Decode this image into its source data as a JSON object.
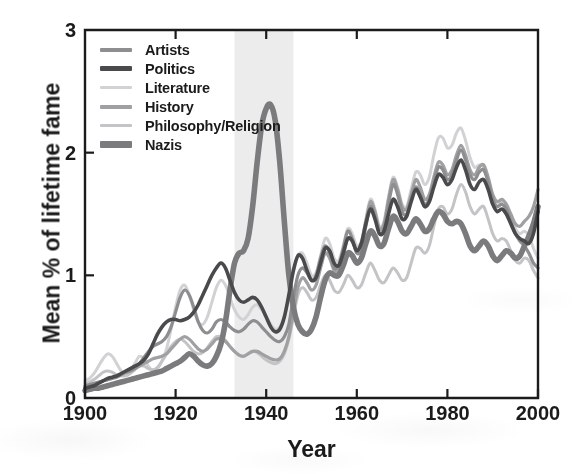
{
  "chart_data": {
    "type": "line",
    "title": "",
    "xlabel": "Year",
    "ylabel": "Mean % of lifetime fame",
    "xlim": [
      1900,
      2000
    ],
    "ylim": [
      0,
      3
    ],
    "xticks": [
      1900,
      1920,
      1940,
      1960,
      1980,
      2000
    ],
    "yticks": [
      0,
      1,
      2,
      3
    ],
    "grid": false,
    "legend_position": "top-left-inside",
    "annotations": [
      {
        "name": "nazi-era-shaded-band",
        "type": "vspan",
        "x_start": 1933,
        "x_end": 1946,
        "color": "#ececed",
        "label": ""
      }
    ],
    "x": [
      1900,
      1901,
      1902,
      1903,
      1904,
      1905,
      1906,
      1907,
      1908,
      1909,
      1910,
      1911,
      1912,
      1913,
      1914,
      1915,
      1916,
      1917,
      1918,
      1919,
      1920,
      1921,
      1922,
      1923,
      1924,
      1925,
      1926,
      1927,
      1928,
      1929,
      1930,
      1931,
      1932,
      1933,
      1934,
      1935,
      1936,
      1937,
      1938,
      1939,
      1940,
      1941,
      1942,
      1943,
      1944,
      1945,
      1946,
      1947,
      1948,
      1949,
      1950,
      1951,
      1952,
      1953,
      1954,
      1955,
      1956,
      1957,
      1958,
      1959,
      1960,
      1961,
      1962,
      1963,
      1964,
      1965,
      1966,
      1967,
      1968,
      1969,
      1970,
      1971,
      1972,
      1973,
      1974,
      1975,
      1976,
      1977,
      1978,
      1979,
      1980,
      1981,
      1982,
      1983,
      1984,
      1985,
      1986,
      1987,
      1988,
      1989,
      1990,
      1991,
      1992,
      1993,
      1994,
      1995,
      1996,
      1997,
      1998,
      1999,
      2000
    ],
    "series": [
      {
        "name": "Artists",
        "color": "#8e8e90",
        "width": 3.2,
        "values": [
          0.1,
          0.11,
          0.12,
          0.13,
          0.14,
          0.15,
          0.16,
          0.17,
          0.19,
          0.21,
          0.22,
          0.24,
          0.28,
          0.33,
          0.38,
          0.42,
          0.44,
          0.46,
          0.5,
          0.58,
          0.7,
          0.82,
          0.88,
          0.84,
          0.74,
          0.62,
          0.55,
          0.53,
          0.56,
          0.62,
          0.64,
          0.62,
          0.58,
          0.55,
          0.54,
          0.56,
          0.6,
          0.63,
          0.62,
          0.58,
          0.54,
          0.5,
          0.47,
          0.46,
          0.5,
          0.6,
          0.82,
          1.0,
          1.06,
          1.02,
          0.96,
          1.0,
          1.14,
          1.24,
          1.18,
          1.06,
          1.08,
          1.22,
          1.36,
          1.3,
          1.18,
          1.22,
          1.4,
          1.56,
          1.48,
          1.34,
          1.38,
          1.58,
          1.74,
          1.66,
          1.52,
          1.5,
          1.62,
          1.72,
          1.66,
          1.58,
          1.62,
          1.76,
          1.88,
          1.86,
          1.78,
          1.82,
          1.94,
          2.02,
          1.94,
          1.82,
          1.78,
          1.84,
          1.86,
          1.76,
          1.62,
          1.56,
          1.58,
          1.54,
          1.44,
          1.34,
          1.28,
          1.24,
          1.18,
          1.1,
          1.06
        ]
      },
      {
        "name": "Politics",
        "color": "#4a4a4c",
        "width": 3.6,
        "values": [
          0.08,
          0.09,
          0.1,
          0.12,
          0.14,
          0.16,
          0.17,
          0.18,
          0.2,
          0.22,
          0.24,
          0.26,
          0.28,
          0.31,
          0.36,
          0.44,
          0.52,
          0.58,
          0.62,
          0.64,
          0.64,
          0.63,
          0.64,
          0.66,
          0.7,
          0.76,
          0.84,
          0.92,
          1.0,
          1.06,
          1.1,
          1.06,
          0.96,
          0.86,
          0.8,
          0.78,
          0.8,
          0.82,
          0.8,
          0.74,
          0.66,
          0.58,
          0.54,
          0.56,
          0.66,
          0.84,
          1.04,
          1.16,
          1.14,
          1.04,
          0.96,
          0.98,
          1.1,
          1.22,
          1.2,
          1.1,
          1.08,
          1.18,
          1.3,
          1.28,
          1.2,
          1.26,
          1.42,
          1.54,
          1.46,
          1.34,
          1.36,
          1.5,
          1.62,
          1.56,
          1.46,
          1.48,
          1.6,
          1.7,
          1.64,
          1.56,
          1.6,
          1.72,
          1.82,
          1.8,
          1.74,
          1.78,
          1.88,
          1.94,
          1.86,
          1.74,
          1.7,
          1.76,
          1.78,
          1.7,
          1.58,
          1.52,
          1.54,
          1.5,
          1.42,
          1.34,
          1.3,
          1.28,
          1.26,
          1.34,
          1.52
        ]
      },
      {
        "name": "Literature",
        "color": "#d2d2d4",
        "width": 3.0,
        "values": [
          0.14,
          0.16,
          0.2,
          0.26,
          0.32,
          0.36,
          0.34,
          0.28,
          0.22,
          0.2,
          0.22,
          0.28,
          0.34,
          0.32,
          0.26,
          0.22,
          0.24,
          0.3,
          0.4,
          0.56,
          0.74,
          0.88,
          0.92,
          0.84,
          0.72,
          0.62,
          0.6,
          0.66,
          0.78,
          0.9,
          0.96,
          0.92,
          0.82,
          0.72,
          0.66,
          0.64,
          0.68,
          0.74,
          0.76,
          0.72,
          0.66,
          0.6,
          0.56,
          0.58,
          0.66,
          0.82,
          1.02,
          1.16,
          1.18,
          1.1,
          1.0,
          1.02,
          1.16,
          1.3,
          1.26,
          1.14,
          1.12,
          1.24,
          1.38,
          1.34,
          1.24,
          1.28,
          1.46,
          1.62,
          1.54,
          1.4,
          1.44,
          1.64,
          1.8,
          1.72,
          1.58,
          1.56,
          1.7,
          1.84,
          1.82,
          1.74,
          1.8,
          1.98,
          2.12,
          2.12,
          2.04,
          2.06,
          2.16,
          2.2,
          2.1,
          1.96,
          1.88,
          1.9,
          1.88,
          1.76,
          1.62,
          1.56,
          1.6,
          1.58,
          1.48,
          1.38,
          1.34,
          1.36,
          1.32,
          1.22,
          1.14
        ]
      },
      {
        "name": "History",
        "color": "#a0a0a2",
        "width": 3.2,
        "values": [
          0.09,
          0.1,
          0.11,
          0.12,
          0.14,
          0.15,
          0.16,
          0.18,
          0.2,
          0.21,
          0.22,
          0.24,
          0.26,
          0.28,
          0.3,
          0.32,
          0.33,
          0.34,
          0.36,
          0.4,
          0.44,
          0.48,
          0.5,
          0.48,
          0.44,
          0.4,
          0.38,
          0.4,
          0.44,
          0.48,
          0.48,
          0.46,
          0.42,
          0.38,
          0.35,
          0.34,
          0.36,
          0.38,
          0.38,
          0.36,
          0.34,
          0.32,
          0.31,
          0.32,
          0.38,
          0.5,
          0.7,
          0.9,
          0.98,
          0.94,
          0.88,
          0.92,
          1.06,
          1.18,
          1.14,
          1.04,
          1.04,
          1.16,
          1.3,
          1.28,
          1.2,
          1.26,
          1.44,
          1.6,
          1.52,
          1.38,
          1.42,
          1.62,
          1.78,
          1.7,
          1.56,
          1.54,
          1.66,
          1.78,
          1.72,
          1.62,
          1.66,
          1.8,
          1.92,
          1.9,
          1.82,
          1.86,
          1.98,
          2.06,
          1.98,
          1.86,
          1.82,
          1.88,
          1.9,
          1.8,
          1.66,
          1.6,
          1.62,
          1.58,
          1.5,
          1.42,
          1.4,
          1.44,
          1.48,
          1.56,
          1.7
        ]
      },
      {
        "name": "Philosophy/Religion",
        "color": "#c4c4c6",
        "width": 3.0,
        "values": [
          0.12,
          0.13,
          0.15,
          0.18,
          0.21,
          0.22,
          0.21,
          0.19,
          0.18,
          0.18,
          0.2,
          0.23,
          0.26,
          0.26,
          0.24,
          0.23,
          0.25,
          0.3,
          0.36,
          0.42,
          0.46,
          0.48,
          0.46,
          0.42,
          0.38,
          0.36,
          0.37,
          0.41,
          0.46,
          0.5,
          0.5,
          0.47,
          0.42,
          0.38,
          0.35,
          0.34,
          0.36,
          0.38,
          0.37,
          0.34,
          0.31,
          0.29,
          0.28,
          0.3,
          0.36,
          0.48,
          0.66,
          0.84,
          0.9,
          0.86,
          0.8,
          0.82,
          0.92,
          1.0,
          0.96,
          0.88,
          0.86,
          0.92,
          1.0,
          0.96,
          0.9,
          0.92,
          1.02,
          1.1,
          1.04,
          0.96,
          0.94,
          1.0,
          1.06,
          1.02,
          0.96,
          0.98,
          1.1,
          1.22,
          1.22,
          1.18,
          1.24,
          1.4,
          1.54,
          1.56,
          1.5,
          1.54,
          1.66,
          1.74,
          1.68,
          1.56,
          1.5,
          1.54,
          1.56,
          1.46,
          1.34,
          1.28,
          1.3,
          1.28,
          1.2,
          1.12,
          1.1,
          1.14,
          1.12,
          1.04,
          0.98
        ]
      },
      {
        "name": "Nazis",
        "color": "#7b7b7d",
        "width": 5.6,
        "values": [
          0.06,
          0.07,
          0.08,
          0.08,
          0.09,
          0.1,
          0.11,
          0.12,
          0.13,
          0.14,
          0.15,
          0.16,
          0.17,
          0.18,
          0.19,
          0.2,
          0.21,
          0.22,
          0.24,
          0.26,
          0.28,
          0.3,
          0.33,
          0.36,
          0.34,
          0.3,
          0.27,
          0.26,
          0.28,
          0.34,
          0.44,
          0.62,
          0.88,
          1.1,
          1.18,
          1.2,
          1.3,
          1.56,
          1.92,
          2.22,
          2.36,
          2.39,
          2.26,
          1.92,
          1.44,
          1.0,
          0.74,
          0.6,
          0.54,
          0.52,
          0.56,
          0.66,
          0.82,
          0.96,
          1.02,
          1.0,
          1.0,
          1.08,
          1.18,
          1.16,
          1.1,
          1.14,
          1.26,
          1.36,
          1.32,
          1.24,
          1.26,
          1.38,
          1.48,
          1.44,
          1.36,
          1.34,
          1.4,
          1.46,
          1.42,
          1.36,
          1.38,
          1.46,
          1.52,
          1.5,
          1.44,
          1.42,
          1.44,
          1.42,
          1.34,
          1.24,
          1.2,
          1.24,
          1.28,
          1.24,
          1.16,
          1.12,
          1.16,
          1.2,
          1.18,
          1.14,
          1.16,
          1.24,
          1.32,
          1.42,
          1.56
        ]
      }
    ]
  },
  "axes": {
    "ylabel": "Mean % of lifetime fame",
    "xlabel": "Year",
    "xtick_labels": [
      "1900",
      "1920",
      "1940",
      "1960",
      "1980",
      "2000"
    ],
    "ytick_labels": [
      "0",
      "1",
      "2",
      "3"
    ],
    "frame_color": "#1b1b1b"
  },
  "legend": {
    "items": [
      {
        "label": "Artists",
        "color": "#8e8e90",
        "thickness": 4
      },
      {
        "label": "Politics",
        "color": "#4a4a4c",
        "thickness": 5
      },
      {
        "label": "Literature",
        "color": "#d2d2d4",
        "thickness": 3
      },
      {
        "label": "History",
        "color": "#a0a0a2",
        "thickness": 4
      },
      {
        "label": "Philosophy/Religion",
        "color": "#c4c4c6",
        "thickness": 3
      },
      {
        "label": "Nazis",
        "color": "#7b7b7d",
        "thickness": 7
      }
    ]
  }
}
